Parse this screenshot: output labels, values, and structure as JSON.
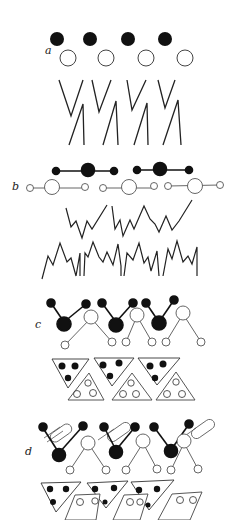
{
  "figure": {
    "panels": [
      {
        "id": "a",
        "label": "a"
      },
      {
        "id": "b",
        "label": "b"
      },
      {
        "id": "c",
        "label": "c"
      },
      {
        "id": "d",
        "label": "d"
      }
    ]
  },
  "colors": {
    "ink": "#111111",
    "line": "#333333",
    "background": "#ffffff"
  }
}
